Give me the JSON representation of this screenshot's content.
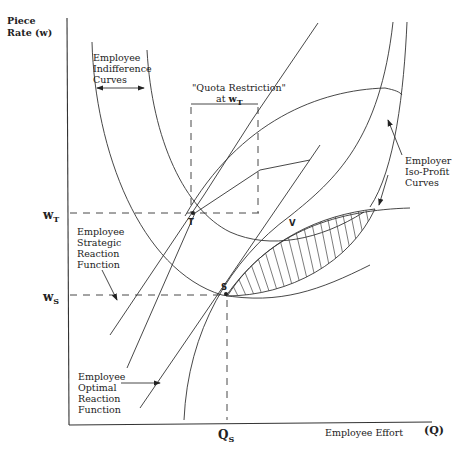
{
  "axes": {
    "y_label_line1": "Piece",
    "y_label_line2": "Rate (w)",
    "x_label": "Employee Effort",
    "x_symbol": "(Q)"
  },
  "levels": {
    "wT_main": "w",
    "wT_sub": "T",
    "wS_main": "w",
    "wS_sub": "S",
    "QS_main": "Q",
    "QS_sub": "S"
  },
  "points": {
    "T": "T",
    "V": "V",
    "S": "S"
  },
  "annotations": {
    "indifference": [
      "Employee",
      "Indifference",
      "Curves"
    ],
    "quota_line1": "\"Quota Restriction\"",
    "quota_line2_prefix": "at ",
    "quota_w": "w",
    "quota_sub": "T",
    "isoprofit": [
      "Employer",
      "Iso-Profit",
      "Curves"
    ],
    "strategic": [
      "Employee",
      "Strategic",
      "Reaction",
      "Function"
    ],
    "optimal": [
      "Employee",
      "Optimal",
      "Reaction",
      "Function"
    ]
  },
  "colors": {
    "ink": "#333333",
    "background": "#ffffff"
  }
}
